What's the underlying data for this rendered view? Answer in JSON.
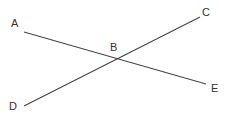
{
  "diagram": {
    "title": "",
    "stroke_color": "#444444",
    "label_color": "#333333",
    "points": {
      "A": {
        "label": "A",
        "x": 24,
        "y": 32,
        "label_x": 11,
        "label_y": 27
      },
      "B": {
        "label": "B",
        "x": 116,
        "y": 59,
        "label_x": 110,
        "label_y": 51
      },
      "C": {
        "label": "C",
        "x": 200,
        "y": 17,
        "label_x": 202,
        "label_y": 16
      },
      "D": {
        "label": "D",
        "x": 24,
        "y": 106,
        "label_x": 9,
        "label_y": 110
      },
      "E": {
        "label": "E",
        "x": 206,
        "y": 84,
        "label_x": 211,
        "label_y": 92
      }
    },
    "lines": [
      {
        "name": "line-AE",
        "from": "A",
        "to": "E",
        "passes_through": "B"
      },
      {
        "name": "line-DC",
        "from": "D",
        "to": "C",
        "passes_through": "B"
      }
    ]
  }
}
